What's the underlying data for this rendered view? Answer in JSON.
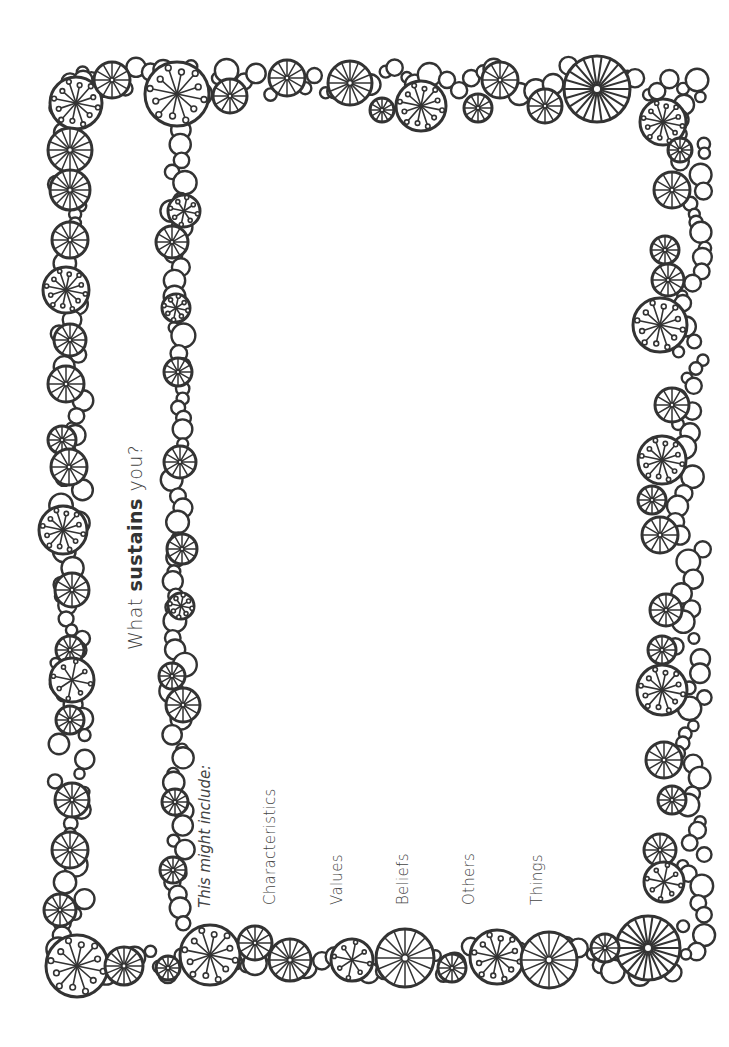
{
  "page": {
    "orientation": "landscape-rotated-90ccw",
    "background": "#ffffff",
    "ink_color": "#333333"
  },
  "title": {
    "prefix": "What ",
    "emphasis": "sustains",
    "suffix": " you?"
  },
  "prompt": {
    "label": "This might include:"
  },
  "items": [
    {
      "label": "Characteristics"
    },
    {
      "label": "Values"
    },
    {
      "label": "Beliefs"
    },
    {
      "label": "Others"
    },
    {
      "label": "Things"
    }
  ],
  "decoration": {
    "style": "hand-drawn doodle circle border",
    "motifs": [
      "plain-circle",
      "spoked-wheel",
      "dandelion-burst"
    ]
  }
}
